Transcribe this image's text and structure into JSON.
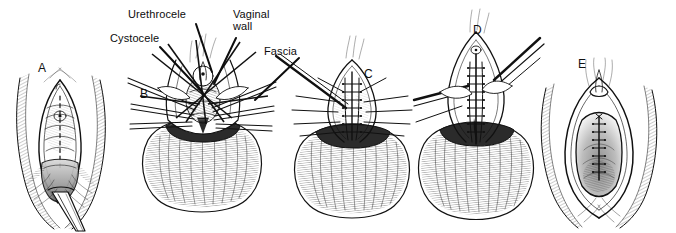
{
  "figure": {
    "width": 676,
    "height": 233,
    "background_color": "#ffffff",
    "ink_color": "#111111",
    "style": "pen-and-ink medical line drawing"
  },
  "panels": [
    {
      "id": "A",
      "label": "A",
      "label_x": 38,
      "label_y": 62,
      "caption": "Vaginal introitus exposed with cystocele and urethrocele present; midline incision marked"
    },
    {
      "id": "B",
      "label": "B",
      "label_x": 140,
      "label_y": 88,
      "caption": "Vaginal wall dissected off the bladder with traction sutures and retractors in place"
    },
    {
      "id": "C",
      "label": "C",
      "label_x": 364,
      "label_y": 68,
      "caption": "Plication of the pubocervical fascia with interrupted sutures"
    },
    {
      "id": "D",
      "label": "D",
      "label_x": 473,
      "label_y": 24,
      "caption": "Fascial layer approximated in the midline; excess vaginal wall trimmed"
    },
    {
      "id": "E",
      "label": "E",
      "label_x": 578,
      "label_y": 58,
      "caption": "Completed closure of the anterior vaginal wall"
    }
  ],
  "callouts": [
    {
      "id": "urethrocele",
      "text": "Urethrocele",
      "text_x": 128,
      "text_y": 9,
      "leader": {
        "x1": 196,
        "y1": 24,
        "x2": 212,
        "y2": 72
      }
    },
    {
      "id": "cystocele",
      "text": "Cystocele",
      "text_x": 110,
      "text_y": 33,
      "leader": {
        "x1": 160,
        "y1": 47,
        "x2": 202,
        "y2": 92
      }
    },
    {
      "id": "vaginal-wall",
      "text": "Vaginal\nwall",
      "text_x": 233,
      "text_y": 9,
      "leader": {
        "x1": 236,
        "y1": 38,
        "x2": 214,
        "y2": 84
      }
    },
    {
      "id": "fascia",
      "text": "Fascia",
      "text_x": 264,
      "text_y": 46,
      "leader": {
        "x1": 299,
        "y1": 58,
        "x2": 255,
        "y2": 100
      }
    }
  ]
}
